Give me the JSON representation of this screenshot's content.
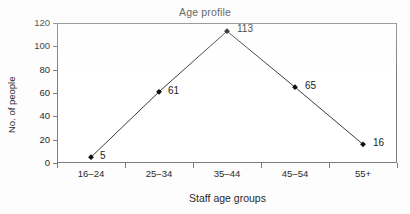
{
  "chart_data": {
    "type": "line",
    "title": "Age profile",
    "xlabel": "Staff age groups",
    "ylabel": "No. of people",
    "categories": [
      "16–24",
      "25–34",
      "35–44",
      "45–54",
      "55+"
    ],
    "values": [
      5,
      61,
      113,
      65,
      16
    ],
    "point_labels": [
      "5",
      "61",
      "113",
      "65",
      "16"
    ],
    "ylim": [
      0,
      120
    ],
    "yticks": [
      0,
      20,
      40,
      60,
      80,
      100,
      120
    ],
    "ytick_labels": [
      "0",
      "20",
      "40",
      "60",
      "80",
      "100",
      "120"
    ],
    "grid": false,
    "legend": "none",
    "marker": "diamond",
    "line_color": "#3b3b3b",
    "marker_color": "#111111",
    "axis_color": "#7d7d7d",
    "background_color": "#ffffff"
  }
}
